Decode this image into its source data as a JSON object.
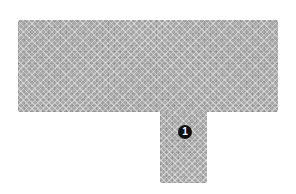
{
  "diagram": {
    "shape": "T-shaped region",
    "fill_pattern": "gray crosshatch",
    "colors": {
      "fill": "#a9a9a9",
      "badge_background": "#111111",
      "badge_text": "#ffffff",
      "background": "#ffffff"
    },
    "callouts": [
      {
        "label": "1"
      }
    ]
  }
}
